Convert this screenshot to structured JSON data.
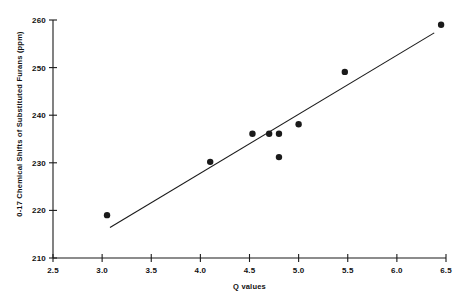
{
  "chart_data": {
    "type": "scatter",
    "title": "",
    "xlabel": "Q values",
    "ylabel": "0-17 Chemical Shifts of Substituted Furans (ppm)",
    "xlim": [
      2.5,
      6.5
    ],
    "ylim": [
      210,
      260
    ],
    "xticks": [
      "2.5",
      "3.0",
      "3.5",
      "4.0",
      "4.5",
      "5.0",
      "5.5",
      "6.0",
      "6.5"
    ],
    "xtick_values": [
      2.5,
      3.0,
      3.5,
      4.0,
      4.5,
      5.0,
      5.5,
      6.0,
      6.5
    ],
    "yticks": [
      "210",
      "220",
      "230",
      "240",
      "250",
      "260"
    ],
    "ytick_values": [
      210,
      220,
      230,
      240,
      250,
      260
    ],
    "grid": false,
    "legend": null,
    "marker": "filled-circle",
    "marker_color": "#1a1a1a",
    "line_color": "#1a1a1a",
    "x": [
      3.05,
      4.1,
      4.53,
      4.7,
      4.8,
      4.8,
      5.0,
      5.47,
      6.45
    ],
    "y": [
      219.0,
      230.2,
      236.1,
      236.1,
      236.1,
      231.2,
      238.1,
      249.1,
      259.0
    ],
    "points": [
      {
        "x": 3.05,
        "y": 219.0
      },
      {
        "x": 4.1,
        "y": 230.2
      },
      {
        "x": 4.53,
        "y": 236.1
      },
      {
        "x": 4.7,
        "y": 236.1
      },
      {
        "x": 4.8,
        "y": 236.1
      },
      {
        "x": 4.8,
        "y": 231.2
      },
      {
        "x": 5.0,
        "y": 238.1
      },
      {
        "x": 5.47,
        "y": 249.1
      },
      {
        "x": 6.45,
        "y": 259.0
      }
    ],
    "trendline": {
      "type": "linear-fit",
      "x_start": 3.08,
      "y_start": 216.4,
      "x_end": 6.38,
      "y_end": 257.3
    }
  },
  "axes": {
    "x_title": "Q values",
    "y_title": "0-17 Chemical Shifts of Substituted Furans (ppm)"
  }
}
